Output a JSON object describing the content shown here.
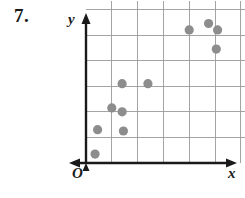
{
  "problem": {
    "number": "7."
  },
  "axes": {
    "y_label": "y",
    "x_label": "x",
    "origin_label": "O"
  },
  "colors": {
    "point": "#8d8d8d",
    "grid": "#9a9a9a",
    "axis": "#1a1a1a",
    "text": "#1a1a1a",
    "background": "#ffffff"
  },
  "chart_data": {
    "type": "scatter",
    "title": "",
    "xlabel": "x",
    "ylabel": "y",
    "grid": true,
    "legend": false,
    "xlim": [
      0,
      6
    ],
    "ylim": [
      0,
      6
    ],
    "xticks": [
      1,
      2,
      3,
      4,
      5,
      6
    ],
    "yticks": [
      1,
      2,
      3,
      4,
      5,
      6
    ],
    "xtick_labels": [],
    "ytick_labels": [],
    "series": [
      {
        "name": "data",
        "points": [
          {
            "x": 0.35,
            "y": 0.35
          },
          {
            "x": 0.45,
            "y": 1.3
          },
          {
            "x": 1.45,
            "y": 1.25
          },
          {
            "x": 1.4,
            "y": 2.0
          },
          {
            "x": 1.0,
            "y": 2.15
          },
          {
            "x": 1.4,
            "y": 3.1
          },
          {
            "x": 2.4,
            "y": 3.1
          },
          {
            "x": 4.0,
            "y": 5.2
          },
          {
            "x": 4.75,
            "y": 5.45
          },
          {
            "x": 5.1,
            "y": 5.2
          },
          {
            "x": 5.05,
            "y": 4.45
          }
        ]
      }
    ]
  }
}
